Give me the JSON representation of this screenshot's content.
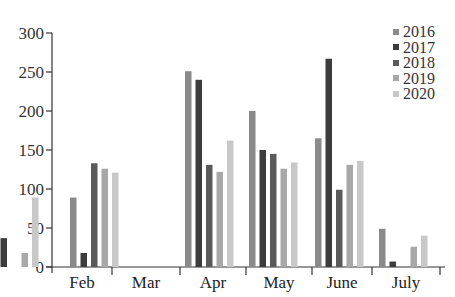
{
  "chart_data": {
    "type": "bar",
    "title": "",
    "xlabel": "",
    "ylabel": "",
    "ylim": [
      0,
      300
    ],
    "yticks": [
      0,
      50,
      100,
      150,
      200,
      250,
      300
    ],
    "grid": false,
    "legend_position": "top-right",
    "categories": [
      "Feb",
      "Mar",
      "Apr",
      "May",
      "June",
      "July"
    ],
    "series": [
      {
        "name": "2016",
        "color": "#8a8a8a",
        "values": [
          null,
          89,
          251,
          200,
          165,
          49
        ]
      },
      {
        "name": "2017",
        "color": "#3c3c3c",
        "values": [
          37,
          18,
          240,
          150,
          267,
          7
        ]
      },
      {
        "name": "2018",
        "color": "#5a5a5a",
        "values": [
          null,
          133,
          131,
          145,
          99,
          null
        ]
      },
      {
        "name": "2019",
        "color": "#a8a8a8",
        "values": [
          18,
          126,
          122,
          126,
          131,
          26
        ]
      },
      {
        "name": "2020",
        "color": "#c8c8c8",
        "values": [
          89,
          121,
          162,
          134,
          136,
          40
        ]
      }
    ]
  }
}
